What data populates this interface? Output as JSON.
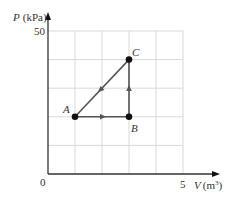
{
  "diagram": {
    "y_axis": {
      "label_var": "P",
      "label_unit": "(kPa)",
      "tick_top": "50"
    },
    "x_axis": {
      "label_var": "V",
      "label_unit": "(m",
      "label_unit_sup": "3",
      "label_unit_close": ")",
      "tick_right": "5"
    },
    "origin_label": "0",
    "points": [
      {
        "name": "A",
        "V": 1,
        "P": 20
      },
      {
        "name": "B",
        "V": 3,
        "P": 20
      },
      {
        "name": "C",
        "V": 3,
        "P": 40
      }
    ],
    "process": [
      "A → B (isobaric)",
      "B → C (isochoric)",
      "C → A (linear)"
    ],
    "colors": {
      "grid": "#d9d9d9",
      "axis": "#333333",
      "path": "#555555",
      "point": "#111111"
    }
  }
}
